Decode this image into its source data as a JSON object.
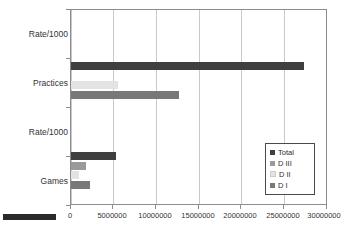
{
  "chart_data": {
    "type": "bar",
    "orientation": "horizontal",
    "title": "",
    "xlabel": "",
    "ylabel": "",
    "categories": [
      "Rate/1000",
      "Practices",
      "Rate/1000",
      "Games"
    ],
    "series": [
      {
        "name": "Total",
        "color": "#3f3f3f",
        "values": [
          0,
          27200000,
          0,
          5200000
        ]
      },
      {
        "name": "D III",
        "color": "#9a9a9a",
        "values": [
          0,
          0,
          0,
          1800000
        ]
      },
      {
        "name": "D II",
        "color": "#e3e3e3",
        "values": [
          0,
          5500000,
          0,
          900000
        ]
      },
      {
        "name": "D I",
        "color": "#787878",
        "values": [
          0,
          12600000,
          0,
          2200000
        ]
      }
    ],
    "xlim": [
      0,
      30000000
    ],
    "xticks": [
      0,
      5000000,
      10000000,
      15000000,
      20000000,
      25000000,
      30000000
    ],
    "xticklabels": [
      "0",
      "5000000",
      "10000000",
      "15000000",
      "20000000",
      "25000000",
      "30000000"
    ],
    "grid": "vertical",
    "legend_position": "bottom-right",
    "legend_entries": [
      "Total",
      "D III",
      "D II",
      "D I"
    ]
  },
  "axis": {
    "y_labels": [
      "Rate/1000",
      "Practices",
      "Rate/1000",
      "Games"
    ],
    "x_labels": [
      "0",
      "5000000",
      "10000000",
      "15000000",
      "20000000",
      "25000000",
      "30000000"
    ]
  },
  "legend": {
    "items": [
      {
        "label": "Total",
        "color": "#3f3f3f"
      },
      {
        "label": "D III",
        "color": "#9a9a9a"
      },
      {
        "label": "D II",
        "color": "#e3e3e3"
      },
      {
        "label": "D I",
        "color": "#787878"
      }
    ]
  },
  "colors": {
    "plot_border": "#8c8c8c",
    "gridline": "#c9c9c9",
    "text": "#333333",
    "background": "#ffffff"
  }
}
